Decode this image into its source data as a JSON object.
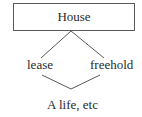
{
  "diagram": {
    "type": "tree",
    "nodes": {
      "root": {
        "label": "House"
      },
      "left": {
        "label": "lease"
      },
      "right": {
        "label": "freehold"
      },
      "bottom": {
        "label": "A life, etc"
      }
    },
    "edges": [
      {
        "from": "root",
        "to": "left"
      },
      {
        "from": "root",
        "to": "right"
      },
      {
        "from": "left",
        "to": "bottom"
      },
      {
        "from": "right",
        "to": "bottom"
      }
    ],
    "colors": {
      "line": "#5a5a5a",
      "text": "#2a2a2a",
      "background": "#ffffff"
    }
  }
}
